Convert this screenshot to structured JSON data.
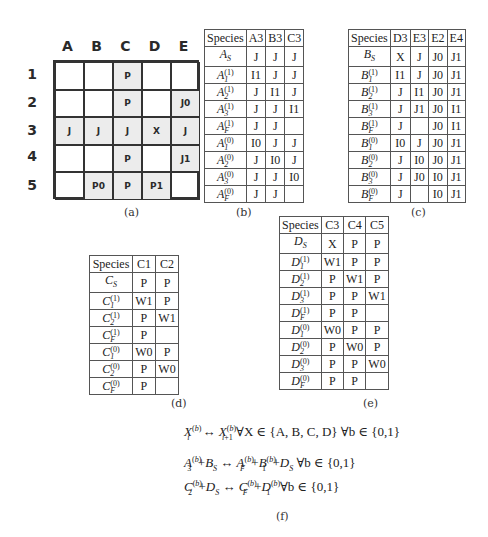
{
  "panel_a": {
    "caption": "(a)",
    "columns": [
      "A",
      "B",
      "C",
      "D",
      "E"
    ],
    "rows": [
      "1",
      "2",
      "3",
      "4",
      "5"
    ],
    "cells": [
      [
        "",
        "",
        "P",
        "",
        ""
      ],
      [
        "",
        "",
        "P",
        "",
        "J0"
      ],
      [
        "J",
        "J",
        "J",
        "X",
        "J"
      ],
      [
        "",
        "",
        "P",
        "",
        "J1"
      ],
      [
        "",
        "P0",
        "P",
        "P1",
        ""
      ]
    ],
    "shaded": [
      [
        false,
        false,
        true,
        false,
        false
      ],
      [
        false,
        false,
        true,
        false,
        true
      ],
      [
        true,
        true,
        true,
        true,
        true
      ],
      [
        false,
        false,
        true,
        false,
        true
      ],
      [
        false,
        true,
        true,
        true,
        false
      ]
    ]
  },
  "panel_b": {
    "caption": "(b)",
    "headers": [
      "Species",
      "A3",
      "B3",
      "C3"
    ],
    "rows": [
      {
        "base": "A",
        "sub": "S",
        "sup": "",
        "vals": [
          "J",
          "J",
          "J"
        ]
      },
      {
        "base": "A",
        "sub": "1",
        "sup": "(1)",
        "vals": [
          "I1",
          "J",
          "J"
        ]
      },
      {
        "base": "A",
        "sub": "2",
        "sup": "(1)",
        "vals": [
          "J",
          "I1",
          "J"
        ]
      },
      {
        "base": "A",
        "sub": "3",
        "sup": "(1)",
        "vals": [
          "J",
          "J",
          "I1"
        ]
      },
      {
        "base": "A",
        "sub": "F",
        "sup": "(1)",
        "vals": [
          "J",
          "J",
          ""
        ]
      },
      {
        "base": "A",
        "sub": "1",
        "sup": "(0)",
        "vals": [
          "I0",
          "J",
          "J"
        ]
      },
      {
        "base": "A",
        "sub": "2",
        "sup": "(0)",
        "vals": [
          "J",
          "I0",
          "J"
        ]
      },
      {
        "base": "A",
        "sub": "3",
        "sup": "(0)",
        "vals": [
          "J",
          "J",
          "I0"
        ]
      },
      {
        "base": "A",
        "sub": "F",
        "sup": "(0)",
        "vals": [
          "J",
          "J",
          ""
        ]
      }
    ]
  },
  "panel_c": {
    "caption": "(c)",
    "headers": [
      "Species",
      "D3",
      "E3",
      "E2",
      "E4"
    ],
    "rows": [
      {
        "base": "B",
        "sub": "S",
        "sup": "",
        "vals": [
          "X",
          "J",
          "J0",
          "J1"
        ]
      },
      {
        "base": "B",
        "sub": "1",
        "sup": "(1)",
        "vals": [
          "I1",
          "J",
          "J0",
          "J1"
        ]
      },
      {
        "base": "B",
        "sub": "2",
        "sup": "(1)",
        "vals": [
          "J",
          "I1",
          "J0",
          "J1"
        ]
      },
      {
        "base": "B",
        "sub": "3",
        "sup": "(1)",
        "vals": [
          "J",
          "J1",
          "J0",
          "I1"
        ]
      },
      {
        "base": "B",
        "sub": "F",
        "sup": "(1)",
        "vals": [
          "J",
          "",
          "J0",
          "I1"
        ]
      },
      {
        "base": "B",
        "sub": "1",
        "sup": "(0)",
        "vals": [
          "I0",
          "J",
          "J0",
          "J1"
        ]
      },
      {
        "base": "B",
        "sub": "2",
        "sup": "(0)",
        "vals": [
          "J",
          "I0",
          "J0",
          "J1"
        ]
      },
      {
        "base": "B",
        "sub": "3",
        "sup": "(0)",
        "vals": [
          "J",
          "J0",
          "I0",
          "J1"
        ]
      },
      {
        "base": "B",
        "sub": "F",
        "sup": "(0)",
        "vals": [
          "J",
          "",
          "I0",
          "J1"
        ]
      }
    ]
  },
  "panel_d": {
    "caption": "(d)",
    "headers": [
      "Species",
      "C1",
      "C2"
    ],
    "rows": [
      {
        "base": "C",
        "sub": "S",
        "sup": "",
        "vals": [
          "P",
          "P"
        ]
      },
      {
        "base": "C",
        "sub": "1",
        "sup": "(1)",
        "vals": [
          "W1",
          "P"
        ]
      },
      {
        "base": "C",
        "sub": "2",
        "sup": "(1)",
        "vals": [
          "P",
          "W1"
        ]
      },
      {
        "base": "C",
        "sub": "F",
        "sup": "(1)",
        "vals": [
          "P",
          ""
        ]
      },
      {
        "base": "C",
        "sub": "1",
        "sup": "(0)",
        "vals": [
          "W0",
          "P"
        ]
      },
      {
        "base": "C",
        "sub": "2",
        "sup": "(0)",
        "vals": [
          "P",
          "W0"
        ]
      },
      {
        "base": "C",
        "sub": "F",
        "sup": "(0)",
        "vals": [
          "P",
          ""
        ]
      }
    ]
  },
  "panel_e": {
    "caption": "(e)",
    "headers": [
      "Species",
      "C3",
      "C4",
      "C5"
    ],
    "rows": [
      {
        "base": "D",
        "sub": "S",
        "sup": "",
        "vals": [
          "X",
          "P",
          "P"
        ]
      },
      {
        "base": "D",
        "sub": "1",
        "sup": "(1)",
        "vals": [
          "W1",
          "P",
          "P"
        ]
      },
      {
        "base": "D",
        "sub": "2",
        "sup": "(1)",
        "vals": [
          "P",
          "W1",
          "P"
        ]
      },
      {
        "base": "D",
        "sub": "3",
        "sup": "(1)",
        "vals": [
          "P",
          "P",
          "W1"
        ]
      },
      {
        "base": "D",
        "sub": "F",
        "sup": "(1)",
        "vals": [
          "P",
          "P",
          ""
        ]
      },
      {
        "base": "D",
        "sub": "1",
        "sup": "(0)",
        "vals": [
          "W0",
          "P",
          "P"
        ]
      },
      {
        "base": "D",
        "sub": "2",
        "sup": "(0)",
        "vals": [
          "P",
          "W0",
          "P"
        ]
      },
      {
        "base": "D",
        "sub": "3",
        "sup": "(0)",
        "vals": [
          "P",
          "P",
          "W0"
        ]
      },
      {
        "base": "D",
        "sub": "F",
        "sup": "(0)",
        "vals": [
          "P",
          "P",
          ""
        ]
      }
    ]
  },
  "panel_f": {
    "caption": "(f)",
    "equations": [
      "X_i^(b) ↔ X_{i+1}^(b) ∀X ∈ {A, B, C, D} ∀b ∈ {0,1}",
      "A_3^(b) + B_S ↔ A_F^(b) + B_1^(b) + D_S ∀b ∈ {0,1}",
      "C_2^(b) + D_S ↔ C_F^(b) + D_1^(b) ∀b ∈ {0,1}"
    ],
    "eq_tail": "∀b ∈ {0,1}",
    "eq1_tail": "∀X ∈ {A, B, C, D} ∀b ∈ {0,1}"
  }
}
